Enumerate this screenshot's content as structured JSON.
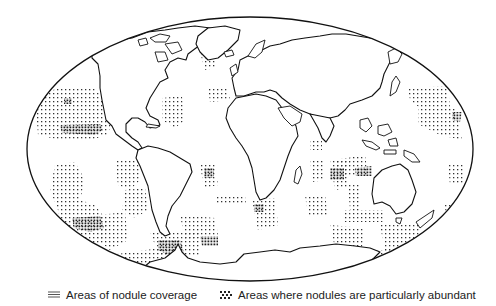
{
  "map": {
    "projection": "world-elliptical",
    "outline_color": "#111111",
    "land_fill": "#ffffff",
    "dot_color": "#333333"
  },
  "legend": {
    "coverage": {
      "icon": "fine-dot-hatch-icon",
      "label": "Areas of nodule coverage"
    },
    "abundant": {
      "icon": "dense-cross-dot-icon",
      "label": "Areas where nodules are particularly abundant"
    }
  }
}
